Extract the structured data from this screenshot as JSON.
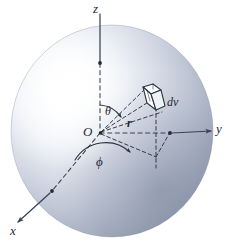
{
  "figure": {
    "width": 234,
    "height": 242,
    "background_color": "#ffffff"
  },
  "sphere": {
    "name": "shaded-sphere",
    "center": {
      "x": 112,
      "y": 131
    },
    "radius_x": 101,
    "radius_y": 106,
    "highlight_color": "#ffffff",
    "mid_color": "#c2c9d9",
    "edge_color": "#8e97ab",
    "shadow_color": "#7a8499",
    "highlight_offset": {
      "x": 28,
      "y": 32
    }
  },
  "axes": [
    {
      "id": "z",
      "label": "z",
      "color": "#3a4154",
      "solid_from": {
        "x": 100,
        "y": 14
      },
      "solid_to": {
        "x": 100,
        "y": 63
      },
      "dashed_from": {
        "x": 100,
        "y": 63
      },
      "dashed_to": {
        "x": 100,
        "y": 133
      },
      "marker_dot": {
        "x": 100,
        "y": 63
      },
      "has_arrow": false
    },
    {
      "id": "y",
      "label": "y",
      "color": "#3a4154",
      "dashed_from": {
        "x": 100,
        "y": 133
      },
      "dashed_to": {
        "x": 170,
        "y": 133
      },
      "solid_from": {
        "x": 170,
        "y": 133
      },
      "solid_to": {
        "x": 213,
        "y": 131
      },
      "marker_dot": {
        "x": 170,
        "y": 133
      },
      "has_arrow": true
    },
    {
      "id": "x",
      "label": "x",
      "color": "#3a4154",
      "dashed_from": {
        "x": 100,
        "y": 133
      },
      "dashed_to": {
        "x": 51,
        "y": 192
      },
      "solid_from": {
        "x": 51,
        "y": 192
      },
      "solid_to": {
        "x": 16,
        "y": 224
      },
      "marker_dot": {
        "x": 51,
        "y": 192
      },
      "has_arrow": true
    }
  ],
  "origin": {
    "name": "origin-point",
    "label": "O",
    "x": 100,
    "y": 133
  },
  "radius_vector": {
    "name": "radius-line",
    "label": "r",
    "from": {
      "x": 100,
      "y": 133
    },
    "to": {
      "x": 155,
      "y": 100
    },
    "style": "dashed"
  },
  "angles": [
    {
      "id": "theta",
      "label": "θ",
      "description": "polar angle between z-axis and radius vector",
      "vertex": {
        "x": 100,
        "y": 133
      },
      "arc_radius": 30,
      "from_deg": -90,
      "to_deg": -31,
      "arrow_at": "end"
    },
    {
      "id": "phi",
      "label": "ϕ",
      "description": "azimuthal angle between x-axis and projection of radius in xy-plane",
      "vertex": {
        "x": 100,
        "y": 133
      },
      "arc_radius": 37,
      "from_deg": 130,
      "to_deg": 43,
      "arrow_at": "end"
    }
  ],
  "volume_element": {
    "name": "volume-element",
    "label": "dv",
    "center": {
      "x": 150,
      "y": 98
    },
    "fill_color": "#ffffff",
    "stroke_color": "#2e3342"
  },
  "projection_lines": {
    "name": "projection-dashed-lines",
    "color": "#3a4154",
    "style": "dashed",
    "segments": [
      {
        "from": {
          "x": 100,
          "y": 133
        },
        "to": {
          "x": 155,
          "y": 156
        }
      },
      {
        "from": {
          "x": 155,
          "y": 100
        },
        "to": {
          "x": 155,
          "y": 156
        }
      },
      {
        "from": {
          "x": 100,
          "y": 133
        },
        "to": {
          "x": 146,
          "y": 90
        }
      },
      {
        "from": {
          "x": 100,
          "y": 133
        },
        "to": {
          "x": 161,
          "y": 110
        }
      }
    ]
  },
  "labels": {
    "z": "z",
    "y": "y",
    "x": "x",
    "origin": "O",
    "radius": "r",
    "volume": "dv",
    "theta": "θ",
    "phi": "ϕ"
  }
}
